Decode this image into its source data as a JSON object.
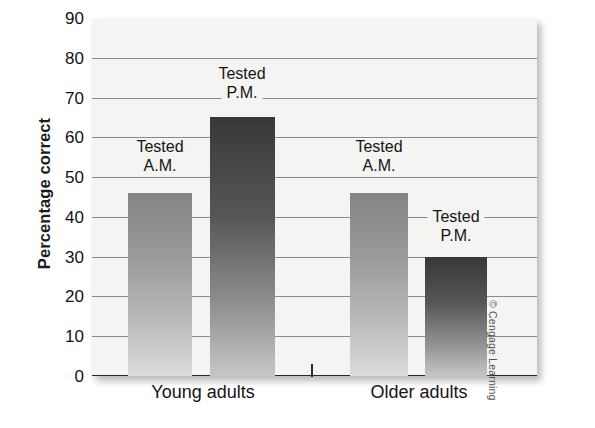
{
  "figure": {
    "credit": "© Cengage Learning"
  },
  "chart_data": {
    "type": "bar",
    "title": "",
    "xlabel": "",
    "ylabel": "Percentage correct",
    "ylim": [
      0,
      90
    ],
    "ytick_step": 10,
    "ytick_labels": [
      "90",
      "80",
      "70",
      "60",
      "50",
      "40",
      "30",
      "20",
      "10",
      "0"
    ],
    "ytick_values": [
      90,
      80,
      70,
      60,
      50,
      40,
      30,
      20,
      10,
      0
    ],
    "grid": true,
    "legend": "none",
    "categories": [
      "Young adults",
      "Older adults"
    ],
    "series": [
      {
        "name": "Tested A.M.",
        "values": [
          46,
          46
        ],
        "color": "#9a9a9a"
      },
      {
        "name": "Tested P.M.",
        "values": [
          65,
          30
        ],
        "color": "#565656"
      }
    ],
    "bars": [
      {
        "group": "Young adults",
        "series": "Tested A.M.",
        "value": 46,
        "shade": "light",
        "annotation_line1": "Tested",
        "annotation_line2": "A.M."
      },
      {
        "group": "Young adults",
        "series": "Tested P.M.",
        "value": 65,
        "shade": "dark",
        "annotation_line1": "Tested",
        "annotation_line2": "P.M."
      },
      {
        "group": "Older adults",
        "series": "Tested A.M.",
        "value": 46,
        "shade": "light",
        "annotation_line1": "Tested",
        "annotation_line2": "A.M."
      },
      {
        "group": "Older adults",
        "series": "Tested P.M.",
        "value": 30,
        "shade": "dark",
        "annotation_line1": "Tested",
        "annotation_line2": "P.M."
      }
    ],
    "colors": {
      "plot_background": "#f4f4f2",
      "gridline": "#8a8a8a",
      "baseline": "#2a2a2a",
      "text": "#151515"
    }
  }
}
